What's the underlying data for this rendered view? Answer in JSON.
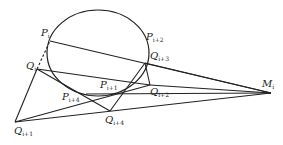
{
  "diagram": {
    "stroke_color": "#222222",
    "background": "#ffffff",
    "ellipse": {
      "cx": 98,
      "cy": 53,
      "rx": 51,
      "ry": 43
    },
    "points": {
      "P_i": {
        "x": 50,
        "y": 41
      },
      "P_i1": {
        "x": 122,
        "y": 87
      },
      "P_i2": {
        "x": 146,
        "y": 48
      },
      "P_i4": {
        "x": 86,
        "y": 94
      },
      "Q_i": {
        "x": 37,
        "y": 69
      },
      "Q_i1": {
        "x": 15,
        "y": 122
      },
      "Q_i2": {
        "x": 150,
        "y": 85
      },
      "Q_i3": {
        "x": 145,
        "y": 63
      },
      "Q_i4": {
        "x": 110,
        "y": 111
      },
      "M_i": {
        "x": 271,
        "y": 93
      }
    },
    "labels": [
      {
        "id": "P_i",
        "base": "P",
        "sub": "i",
        "x": 41,
        "y": 28
      },
      {
        "id": "P_i2",
        "base": "P",
        "sub": "i+2",
        "x": 146,
        "y": 32
      },
      {
        "id": "Q_i3",
        "base": "Q",
        "sub": "i+3",
        "x": 150,
        "y": 51
      },
      {
        "id": "Q_i",
        "base": "Q",
        "sub": "i",
        "x": 26,
        "y": 61
      },
      {
        "id": "P_i1",
        "base": "P",
        "sub": "i+1",
        "x": 100,
        "y": 80
      },
      {
        "id": "Q_i2",
        "base": "Q",
        "sub": "i+2",
        "x": 150,
        "y": 87
      },
      {
        "id": "P_i4",
        "base": "P",
        "sub": "i+4",
        "x": 62,
        "y": 92
      },
      {
        "id": "M_i",
        "base": "M",
        "sub": "i",
        "x": 262,
        "y": 79
      },
      {
        "id": "Q_i4",
        "base": "Q",
        "sub": "i+4",
        "x": 105,
        "y": 115
      },
      {
        "id": "Q_i1",
        "base": "Q",
        "sub": "i+1",
        "x": 14,
        "y": 126
      }
    ],
    "segments": [
      {
        "from": "P_i",
        "to": "M_i",
        "style": "solid"
      },
      {
        "from": "Q_i",
        "to": "P_i",
        "style": "dashed"
      },
      {
        "from": "Q_i",
        "to": "Q_i2",
        "style": "solid"
      },
      {
        "from": "Q_i",
        "to": "Q_i4",
        "style": "solid"
      },
      {
        "from": "Q_i",
        "to": "Q_i1",
        "style": "solid"
      },
      {
        "from": "Q_i1",
        "to": "M_i",
        "style": "solid"
      },
      {
        "from": "Q_i1",
        "to": "Q_i2",
        "style": "solid"
      },
      {
        "from": "Q_i4",
        "to": "Q_i3",
        "style": "solid"
      },
      {
        "from": "Q_i3",
        "to": "Q_i2",
        "style": "solid"
      },
      {
        "from": "Q_i3",
        "to": "M_i",
        "style": "solid"
      },
      {
        "from": "Q_i2",
        "to": "M_i",
        "style": "solid"
      },
      {
        "from": "P_i4",
        "to": "M_i",
        "style": "solid"
      }
    ]
  }
}
